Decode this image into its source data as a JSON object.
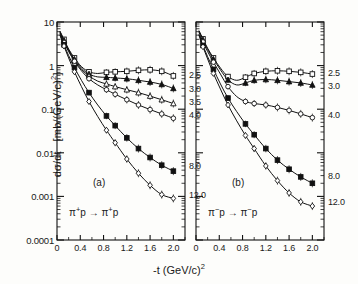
{
  "figure": {
    "axis_x_title": "-t  (GeV/c)",
    "axis_x_title_sup": "2",
    "axis_y_title_main": "dσ/dt",
    "axis_y_title_units": "[mb/(GeV/c)",
    "axis_y_title_sup": "2",
    "axis_y_title_close": "]"
  },
  "chart_data": {
    "type": "line",
    "title": "",
    "xlabel": "-t (GeV/c)^2",
    "ylabel": "dσ/dt [mb/(GeV/c)^2]",
    "yscale": "log",
    "ylim": [
      0.0001,
      10
    ],
    "xlim": [
      0,
      2.2
    ],
    "grid": false,
    "legend": "inline-right-labels",
    "ytick_labels": [
      "10",
      "1",
      "0.1",
      "0.01",
      "0.001",
      "0.0001"
    ],
    "ytick_values": [
      10,
      1,
      0.1,
      0.01,
      0.001,
      0.0001
    ],
    "xtick_labels": [
      "0",
      "0.4",
      "0.8",
      "1.2",
      "1.6",
      "2.0"
    ],
    "xtick_values": [
      0,
      0.4,
      0.8,
      1.2,
      1.6,
      2.0
    ],
    "panels": [
      {
        "tag": "(a)",
        "reaction_lhs": "π",
        "reaction_lhs_sup": "+",
        "reaction_lhs_tail": "p",
        "reaction_arrow": "→",
        "reaction_rhs": "π",
        "reaction_rhs_sup": "+",
        "reaction_rhs_tail": "p",
        "reaction": "π+p → π+p",
        "series": [
          {
            "name": "2.5",
            "label": "2.5",
            "marker": "open-square",
            "x": [
              0.05,
              0.12,
              0.2,
              0.3,
              0.42,
              0.55,
              0.7,
              0.85,
              1.0,
              1.2,
              1.4,
              1.6,
              1.8,
              2.0
            ],
            "y": [
              6.2,
              4.0,
              2.4,
              1.5,
              0.95,
              0.72,
              0.66,
              0.7,
              0.72,
              0.74,
              0.78,
              0.8,
              0.74,
              0.58
            ]
          },
          {
            "name": "3.0",
            "label": "3.0",
            "marker": "filled-triangle",
            "x": [
              0.05,
              0.12,
              0.2,
              0.3,
              0.42,
              0.55,
              0.7,
              0.85,
              1.0,
              1.2,
              1.4,
              1.6,
              1.8,
              2.0
            ],
            "y": [
              6.0,
              3.8,
              2.3,
              1.4,
              0.88,
              0.64,
              0.55,
              0.54,
              0.52,
              0.5,
              0.46,
              0.42,
              0.37,
              0.3
            ]
          },
          {
            "name": "3.5",
            "label": "3.5",
            "marker": "open-triangle",
            "x": [
              0.05,
              0.12,
              0.2,
              0.3,
              0.42,
              0.55,
              0.7,
              0.85,
              1.0,
              1.2,
              1.4,
              1.6,
              1.8,
              2.0
            ],
            "y": [
              5.8,
              3.6,
              2.2,
              1.32,
              0.82,
              0.58,
              0.44,
              0.38,
              0.33,
              0.28,
              0.24,
              0.2,
              0.165,
              0.135
            ]
          },
          {
            "name": "4.0",
            "label": "4.0",
            "marker": "open-circle",
            "x": [
              0.05,
              0.12,
              0.2,
              0.3,
              0.42,
              0.55,
              0.7,
              0.85,
              1.0,
              1.2,
              1.4,
              1.6,
              1.8,
              2.0
            ],
            "y": [
              5.6,
              3.4,
              2.1,
              1.26,
              0.76,
              0.5,
              0.36,
              0.28,
              0.22,
              0.165,
              0.125,
              0.098,
              0.078,
              0.062
            ]
          },
          {
            "name": "8.0",
            "label": "8.0",
            "marker": "filled-square",
            "x": [
              0.05,
              0.12,
              0.2,
              0.3,
              0.42,
              0.55,
              0.7,
              0.85,
              1.0,
              1.2,
              1.4,
              1.6,
              1.8,
              2.0
            ],
            "y": [
              5.2,
              3.0,
              1.7,
              0.9,
              0.46,
              0.24,
              0.125,
              0.07,
              0.042,
              0.022,
              0.0125,
              0.0078,
              0.0052,
              0.0038
            ]
          },
          {
            "name": "12.0",
            "label": "12.0",
            "marker": "open-diamond",
            "x": [
              0.05,
              0.12,
              0.2,
              0.3,
              0.42,
              0.55,
              0.7,
              0.85,
              1.0,
              1.2,
              1.4,
              1.6,
              1.8,
              2.0
            ],
            "y": [
              5.0,
              2.8,
              1.5,
              0.72,
              0.33,
              0.15,
              0.068,
              0.033,
              0.017,
              0.0072,
              0.0034,
              0.0018,
              0.0011,
              0.0009
            ]
          }
        ]
      },
      {
        "tag": "(b)",
        "reaction_lhs": "π",
        "reaction_lhs_sup": "−",
        "reaction_lhs_tail": "p",
        "reaction_arrow": "→",
        "reaction_rhs": "π",
        "reaction_rhs_sup": "−",
        "reaction_rhs_tail": "p",
        "reaction": "π−p → π−p",
        "series": [
          {
            "name": "2.5",
            "label": "2.5",
            "marker": "open-square",
            "x": [
              0.05,
              0.12,
              0.2,
              0.3,
              0.42,
              0.55,
              0.7,
              0.85,
              1.0,
              1.2,
              1.4,
              1.6,
              1.8,
              2.0
            ],
            "y": [
              6.4,
              4.1,
              2.5,
              1.5,
              0.88,
              0.56,
              0.46,
              0.54,
              0.66,
              0.74,
              0.76,
              0.74,
              0.7,
              0.64
            ]
          },
          {
            "name": "3.0",
            "label": "3.0",
            "marker": "filled-triangle",
            "x": [
              0.05,
              0.12,
              0.2,
              0.3,
              0.42,
              0.55,
              0.7,
              0.85,
              1.0,
              1.2,
              1.4,
              1.6,
              1.8,
              2.0
            ],
            "y": [
              6.2,
              3.9,
              2.35,
              1.4,
              0.8,
              0.47,
              0.36,
              0.4,
              0.46,
              0.48,
              0.46,
              0.43,
              0.4,
              0.36
            ]
          },
          {
            "name": "4.0",
            "label": "4.0",
            "marker": "open-circle",
            "x": [
              0.05,
              0.12,
              0.2,
              0.3,
              0.42,
              0.55,
              0.7,
              0.85,
              1.0,
              1.2,
              1.4,
              1.6,
              1.8,
              2.0
            ],
            "y": [
              5.8,
              3.5,
              2.1,
              1.2,
              0.64,
              0.33,
              0.195,
              0.15,
              0.135,
              0.125,
              0.11,
              0.094,
              0.078,
              0.064
            ]
          },
          {
            "name": "8.0",
            "label": "8.0",
            "marker": "filled-square",
            "x": [
              0.05,
              0.12,
              0.2,
              0.3,
              0.42,
              0.55,
              0.7,
              0.85,
              1.0,
              1.2,
              1.4,
              1.6,
              1.8,
              2.0
            ],
            "y": [
              5.2,
              2.9,
              1.6,
              0.82,
              0.38,
              0.18,
              0.088,
              0.046,
              0.026,
              0.0125,
              0.0068,
              0.0042,
              0.0028,
              0.002
            ]
          },
          {
            "name": "12.0",
            "label": "12.0",
            "marker": "open-diamond",
            "x": [
              0.05,
              0.12,
              0.2,
              0.3,
              0.42,
              0.55,
              0.7,
              0.85,
              1.0,
              1.2,
              1.4,
              1.6,
              1.8,
              2.0
            ],
            "y": [
              5.0,
              2.7,
              1.42,
              0.66,
              0.29,
              0.125,
              0.054,
              0.025,
              0.0125,
              0.005,
              0.0023,
              0.0012,
              0.00075,
              0.0006
            ]
          }
        ]
      }
    ]
  }
}
